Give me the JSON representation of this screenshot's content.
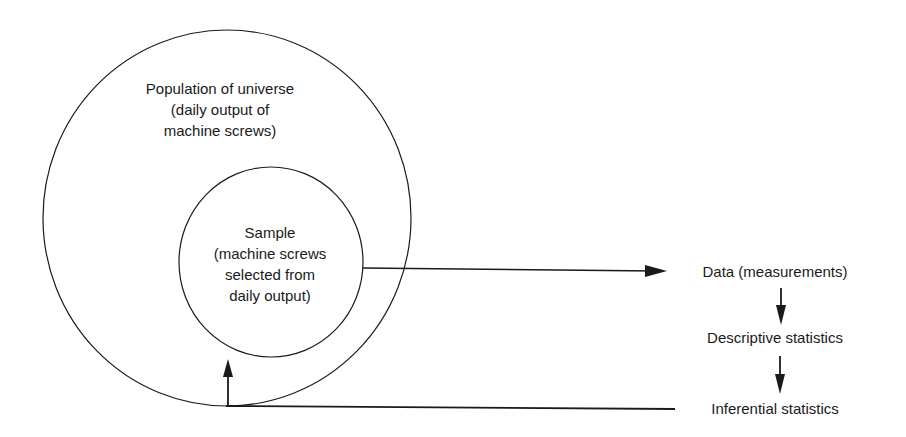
{
  "diagram": {
    "population": {
      "lines": [
        "Population of universe",
        "(daily output of",
        "machine screws)"
      ]
    },
    "sample": {
      "lines": [
        "Sample",
        "(machine screws",
        "selected from",
        "daily output)"
      ]
    },
    "flow": [
      {
        "label": "Data (measurements)"
      },
      {
        "label": "Descriptive statistics"
      },
      {
        "label": "Inferential statistics"
      }
    ],
    "colors": {
      "stroke": "#1a1a1a",
      "background": "#ffffff"
    }
  }
}
